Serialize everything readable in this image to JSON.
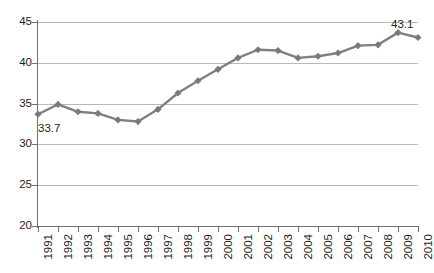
{
  "chart_data": {
    "type": "line",
    "title": "",
    "subtitle": "",
    "xlabel": "",
    "ylabel": "",
    "categories": [
      "1991",
      "1992",
      "1993",
      "1994",
      "1995",
      "1996",
      "1997",
      "1998",
      "1999",
      "2000",
      "2001",
      "2002",
      "2003",
      "2004",
      "2005",
      "2006",
      "2007",
      "2008",
      "2009",
      "2010"
    ],
    "values": [
      33.7,
      34.9,
      34.0,
      33.8,
      33.0,
      32.8,
      34.3,
      36.3,
      37.8,
      39.2,
      40.6,
      41.6,
      41.5,
      40.6,
      40.8,
      41.2,
      42.1,
      42.2,
      43.7,
      43.1
    ],
    "series": [
      {
        "name": "",
        "values": [
          33.7,
          34.9,
          34.0,
          33.8,
          33.0,
          32.8,
          34.3,
          36.3,
          37.8,
          39.2,
          40.6,
          41.6,
          41.5,
          40.6,
          40.8,
          41.2,
          42.1,
          42.2,
          43.7,
          43.1
        ]
      }
    ],
    "ylim": [
      20,
      45
    ],
    "yticks": [
      20,
      25,
      30,
      35,
      40,
      45
    ],
    "ytick_labels": [
      "20",
      "25",
      "30",
      "35",
      "40",
      "45"
    ],
    "grid": true,
    "grid_axis": "y",
    "legend": false,
    "legend_position": "none",
    "marker": "diamond",
    "line_color": "#808080",
    "marker_color": "#7a7a7a",
    "grid_color": "#b9b9b9",
    "axis_color": "#6f6f6f",
    "text_color": "#1d1d1d",
    "data_labels": [
      {
        "category": "1991",
        "value": 33.7,
        "text": "33.7"
      },
      {
        "category": "2010",
        "value": 43.1,
        "text": "43.1"
      }
    ],
    "xtick_label_rotation": -90
  }
}
